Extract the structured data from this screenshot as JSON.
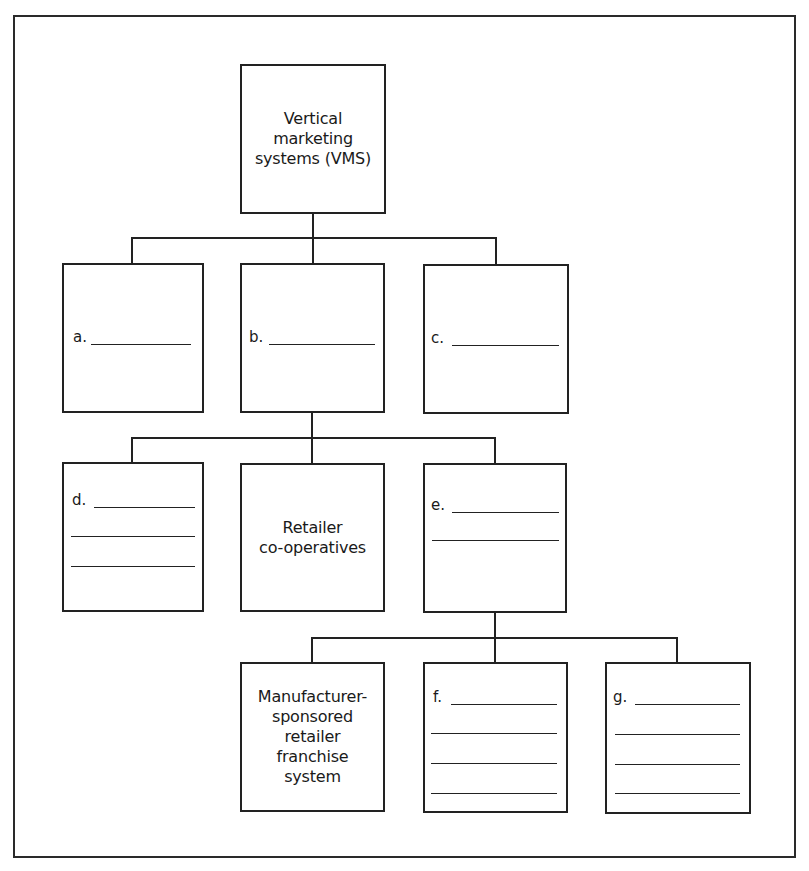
{
  "diagram": {
    "type": "hierarchy-tree",
    "root": {
      "id": "vms",
      "lines": [
        "Vertical",
        "marketing",
        "systems (VMS)"
      ]
    },
    "level1": [
      {
        "id": "a",
        "label": "a.",
        "blank_lines": 1
      },
      {
        "id": "b",
        "label": "b.",
        "blank_lines": 1
      },
      {
        "id": "c",
        "label": "c.",
        "blank_lines": 1
      }
    ],
    "level2_parent": "b",
    "level2": [
      {
        "id": "d",
        "label": "d.",
        "blank_lines": 3
      },
      {
        "id": "retailer",
        "lines": [
          "Retailer",
          "co-operatives"
        ]
      },
      {
        "id": "e",
        "label": "e.",
        "blank_lines": 2
      }
    ],
    "level3_parent": "e",
    "level3": [
      {
        "id": "manufacturer",
        "lines": [
          "Manufacturer-",
          "sponsored",
          "retailer",
          "franchise",
          "system"
        ]
      },
      {
        "id": "f",
        "label": "f.",
        "blank_lines": 4
      },
      {
        "id": "g",
        "label": "g.",
        "blank_lines": 4
      }
    ],
    "colors": {
      "line": "#222222",
      "background": "#ffffff"
    }
  }
}
